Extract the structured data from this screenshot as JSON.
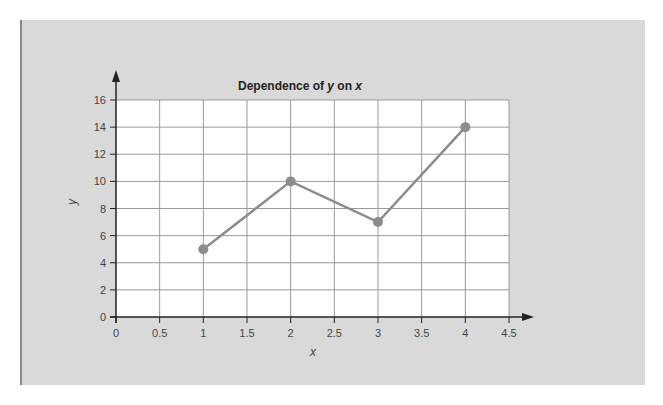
{
  "chart_data": {
    "type": "line",
    "title": "Dependence of y on x",
    "title_parts": {
      "prefix": "Dependence of ",
      "y": "y",
      "mid": " on ",
      "x": "x"
    },
    "xlabel": "x",
    "ylabel": "y",
    "x": [
      1,
      2,
      3,
      4
    ],
    "series": [
      {
        "name": "y",
        "values": [
          5,
          10,
          7,
          14
        ],
        "color": "#8c8c8c"
      }
    ],
    "xlim": [
      0,
      4.5
    ],
    "ylim": [
      0,
      16
    ],
    "xticks": [
      "0",
      "0.5",
      "1",
      "1.5",
      "2",
      "2.5",
      "3",
      "3.5",
      "4",
      "4.5"
    ],
    "yticks": [
      "0",
      "2",
      "4",
      "6",
      "8",
      "10",
      "12",
      "14",
      "16"
    ],
    "grid": true,
    "legend": null
  },
  "colors": {
    "panel_bg": "#d9d9d9",
    "plot_bg": "#ffffff",
    "grid": "#999999",
    "axis": "#222222",
    "line": "#8c8c8c"
  }
}
